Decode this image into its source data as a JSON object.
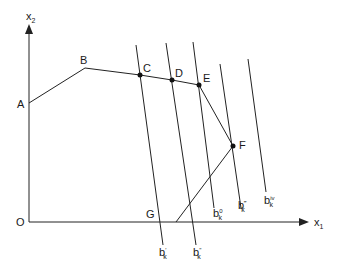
{
  "diagram": {
    "axes": {
      "x_label": "x",
      "x_subscript": "1",
      "y_label": "x",
      "y_subscript": "2",
      "origin_label": "O"
    },
    "points": [
      {
        "id": "A",
        "label": "A",
        "x": 29,
        "y": 103
      },
      {
        "id": "B",
        "label": "B",
        "x": 85,
        "y": 68
      },
      {
        "id": "C",
        "label": "C",
        "x": 140,
        "y": 75
      },
      {
        "id": "D",
        "label": "D",
        "x": 172,
        "y": 80
      },
      {
        "id": "E",
        "label": "E",
        "x": 199,
        "y": 85
      },
      {
        "id": "F",
        "label": "F",
        "x": 233,
        "y": 146
      },
      {
        "id": "G",
        "label": "G",
        "x": 176,
        "y": 222
      }
    ],
    "budget_lines": [
      {
        "id": "b1",
        "base": "b",
        "sub": "k",
        "sup": "′"
      },
      {
        "id": "b2",
        "base": "b",
        "sub": "k",
        "sup": "″"
      },
      {
        "id": "b0",
        "base": "b",
        "sub": "k",
        "sup": "0"
      },
      {
        "id": "b3",
        "base": "b",
        "sub": "k",
        "sup": "‴"
      },
      {
        "id": "b4",
        "base": "b",
        "sub": "k",
        "sup": "iv"
      }
    ]
  }
}
